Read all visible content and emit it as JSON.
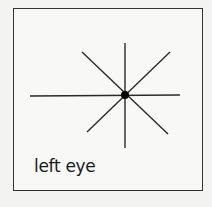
{
  "figure": {
    "label": "left eye",
    "center": {
      "x": 125,
      "y": 95
    },
    "lines": [
      {
        "name": "horizontal",
        "x1": 30,
        "y1": 96,
        "x2": 180,
        "y2": 95
      },
      {
        "name": "vertical",
        "x1": 125,
        "y1": 43,
        "x2": 125,
        "y2": 148
      },
      {
        "name": "diagonal-down",
        "x1": 82,
        "y1": 52,
        "x2": 168,
        "y2": 134
      },
      {
        "name": "diagonal-up",
        "x1": 87,
        "y1": 132,
        "x2": 170,
        "y2": 52
      }
    ],
    "line_color": "#2a2a2a",
    "dot_color": "#000000"
  }
}
